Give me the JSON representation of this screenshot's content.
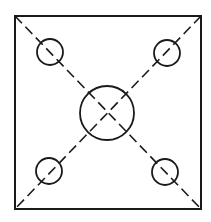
{
  "diagram": {
    "type": "plate-with-holes",
    "background": "#ffffff",
    "stroke_color": "#1a1a1a",
    "square": {
      "x1": 15,
      "y1": 16,
      "x2": 201,
      "y2": 209,
      "stroke_width": 2
    },
    "diagonals": [
      {
        "name": "diagonal-tl-br",
        "x1": 15,
        "y1": 16,
        "x2": 201,
        "y2": 209
      },
      {
        "name": "diagonal-tr-bl",
        "x1": 201,
        "y1": 16,
        "x2": 15,
        "y2": 209
      }
    ],
    "dash_pattern": "10,5",
    "center_hole": {
      "cx": 107,
      "cy": 113,
      "r": 27
    },
    "corner_holes": [
      {
        "name": "hole-top-left",
        "cx": 50,
        "cy": 52,
        "r": 13
      },
      {
        "name": "hole-top-right",
        "cx": 167,
        "cy": 53,
        "r": 13
      },
      {
        "name": "hole-bottom-left",
        "cx": 49,
        "cy": 171,
        "r": 13
      },
      {
        "name": "hole-bottom-right",
        "cx": 165,
        "cy": 172,
        "r": 13
      }
    ]
  }
}
